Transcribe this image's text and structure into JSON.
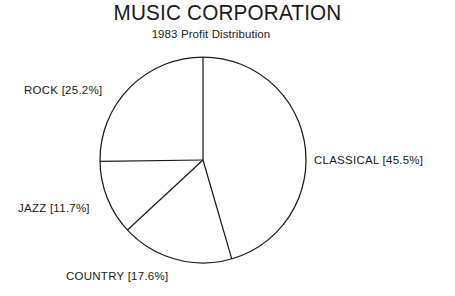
{
  "chart_data": {
    "type": "pie",
    "title": "MUSIC CORPORATION",
    "subtitle": "1983 Profit Distribution",
    "xlabel": "",
    "ylabel": "",
    "legend_position": "none",
    "grid": false,
    "start_angle_deg": 0,
    "direction": "clockwise",
    "categories": [
      "CLASSICAL",
      "COUNTRY",
      "JAZZ",
      "ROCK"
    ],
    "values": [
      45.5,
      17.6,
      11.7,
      25.2
    ],
    "value_unit": "%",
    "labels": [
      "CLASSICAL  [45.5%]",
      "COUNTRY  [17.6%]",
      "JAZZ  [11.7%]",
      "ROCK  [25.2%]"
    ],
    "slices": [
      {
        "name": "CLASSICAL",
        "value": 45.5,
        "label": "CLASSICAL  [45.5%]",
        "start_deg": 0.0,
        "end_deg": 163.8
      },
      {
        "name": "COUNTRY",
        "value": 17.6,
        "label": "COUNTRY  [17.6%]",
        "start_deg": 163.8,
        "end_deg": 227.2
      },
      {
        "name": "JAZZ",
        "value": 11.7,
        "label": "JAZZ  [11.7%]",
        "start_deg": 227.2,
        "end_deg": 269.3
      },
      {
        "name": "ROCK",
        "value": 25.2,
        "label": "ROCK  [25.2%]",
        "start_deg": 269.3,
        "end_deg": 360.0
      }
    ],
    "colors": {
      "background": "#ffffff",
      "stroke": "#1b1b1b",
      "text": "#1a1a1a"
    }
  }
}
